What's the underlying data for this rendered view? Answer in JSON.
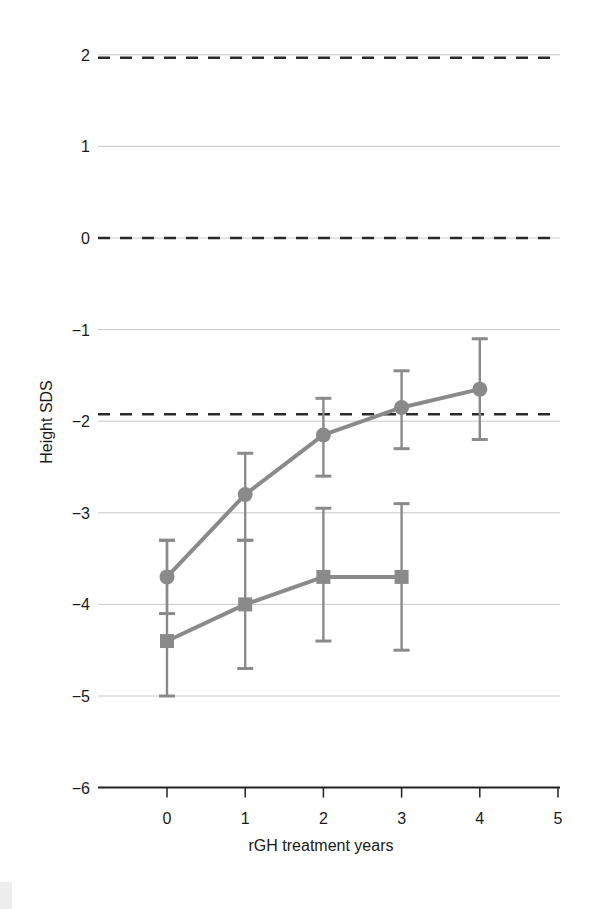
{
  "chart_data": {
    "type": "line",
    "title": "",
    "xlabel": "rGH treatment years",
    "ylabel": "Height SDS",
    "xlim": [
      -0.85,
      5
    ],
    "ylim": [
      -6,
      2
    ],
    "x_ticks": [
      0,
      1,
      2,
      3,
      4,
      5
    ],
    "x_tick_labels": [
      "0",
      "1",
      "2",
      "3",
      "4",
      "5"
    ],
    "y_ticks": [
      2,
      1,
      0,
      -1,
      -2,
      -3,
      -4,
      -5,
      -6
    ],
    "y_tick_labels": [
      "2",
      "1",
      "0",
      "−1",
      "−2",
      "−3",
      "−4",
      "−5",
      "−6"
    ],
    "grid": true,
    "reference_lines": [
      {
        "y": 2,
        "style": "dashed"
      },
      {
        "y": 0,
        "style": "dashed"
      },
      {
        "y": -2,
        "style": "dashed"
      }
    ],
    "legend": null,
    "series": [
      {
        "name": "circle-series",
        "marker": "circle",
        "color": "#8a8a8a",
        "x": [
          0,
          1,
          2,
          3,
          4
        ],
        "values": [
          -3.7,
          -2.8,
          -2.15,
          -1.85,
          -1.65
        ],
        "error_low": [
          -4.1,
          -3.3,
          -2.6,
          -2.3,
          -2.2
        ],
        "error_high": [
          -3.3,
          -2.35,
          -1.75,
          -1.45,
          -1.1
        ]
      },
      {
        "name": "square-series",
        "marker": "square",
        "color": "#8a8a8a",
        "x": [
          0,
          1,
          2,
          3
        ],
        "values": [
          -4.4,
          -4.0,
          -3.7,
          -3.7
        ],
        "error_low": [
          -5.0,
          -4.7,
          -4.4,
          -4.5
        ],
        "error_high": [
          -3.3,
          -3.3,
          -2.95,
          -2.9
        ]
      }
    ]
  },
  "colors": {
    "series": "#8a8a8a",
    "grid": "#c8c8c8",
    "dashed": "#2a2a2a",
    "axis": "#222222",
    "text": "#1a1a1a"
  }
}
